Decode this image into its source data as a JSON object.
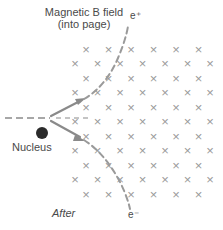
{
  "diagram": {
    "field_caption_line1": "Magnetic B field",
    "field_caption_line2": "(into page)",
    "nucleus_label": "Nucleus",
    "stage_label": "After",
    "positron_label": "e⁺",
    "electron_label": "e⁻",
    "field_symbol": "×",
    "field_direction": "into page",
    "colors": {
      "field_mark": "#9a9a9a",
      "trajectory": "#8a8a8a",
      "arrow": "#8a8a8a",
      "photon": "#8a8a8a",
      "nucleus": "#2b2b2b",
      "text": "#4a4a4a",
      "background": "#ffffff"
    },
    "field_grid": {
      "rows": 11,
      "row_spacing": 14.5,
      "col_spacing": 22.5,
      "first_row_y": 49,
      "even_row_start_x": 86,
      "odd_row_start_x": 75,
      "even_row_count": 6,
      "odd_row_count": 7
    },
    "nucleus": {
      "cx": 42,
      "cy": 133,
      "r": 6
    },
    "vertex": {
      "x": 50,
      "y": 118
    },
    "photon_in": {
      "x1": 5,
      "y1": 118,
      "x2": 50,
      "y2": 118
    },
    "photon_through": {
      "x1": 55,
      "y1": 118,
      "x2": 90,
      "y2": 118
    },
    "positron_arrow": {
      "x1": 51,
      "y1": 116,
      "x2": 84,
      "y2": 99
    },
    "electron_arrow": {
      "x1": 51,
      "y1": 121,
      "x2": 84,
      "y2": 140
    },
    "positron_path": "M84,99 C98,91 110,77 118,58 C124,44 127,33 128,26",
    "electron_path": "M84,140 C98,149 110,163 120,182 C126,194 129,204 130,209"
  }
}
